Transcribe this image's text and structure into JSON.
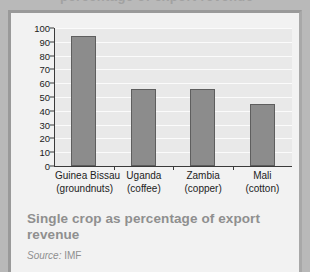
{
  "page": {
    "clipped_headline_fragment": "percentage of export revenue"
  },
  "caption": {
    "title": "Single crop as percentage of export revenue",
    "source_label": "Source:",
    "source_value": "IMF"
  },
  "chart_data": {
    "type": "bar",
    "title": "Single crop as percentage of export revenue",
    "xlabel": "",
    "ylabel": "",
    "ylim": [
      0,
      100
    ],
    "yticks": [
      0,
      10,
      20,
      30,
      40,
      50,
      60,
      70,
      80,
      90,
      100
    ],
    "ytick_labels": [
      "0",
      "10",
      "20",
      "30",
      "40",
      "50",
      "60",
      "70",
      "80",
      "90",
      "100"
    ],
    "grid": true,
    "legend": "none",
    "source": "Source: IMF",
    "bar_color": "#8c8c8c",
    "bar_edge_color": "#5e5e5e",
    "plot_background": "#e9e9e9",
    "categories": [
      "Guinea Bissau (groundnuts)",
      "Uganda (coffee)",
      "Zambia (copper)",
      "Mali (cotton)"
    ],
    "category_lines": [
      {
        "line1": "Guinea Bissau",
        "line2": "(groundnuts)"
      },
      {
        "line1": "Uganda",
        "line2": "(coffee)"
      },
      {
        "line1": "Zambia",
        "line2": "(copper)"
      },
      {
        "line1": "Mali",
        "line2": "(cotton)"
      }
    ],
    "values": [
      94,
      56,
      56,
      45
    ]
  }
}
